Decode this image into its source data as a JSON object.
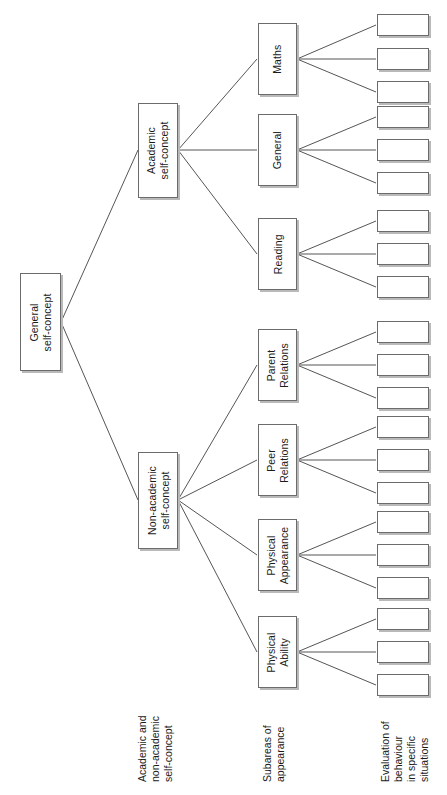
{
  "diagram": {
    "orientation": "rotated-90-ccw",
    "line_color": "#555555",
    "box_border_color": "#6b6b6b",
    "box_shadow_color": "#b9b9b9",
    "background": "#ffffff"
  },
  "root": {
    "label": "General\nself-concept",
    "line1": "General",
    "line2": "self-concept"
  },
  "level2": [
    {
      "id": "academic",
      "line1": "Academic",
      "line2": "self-concept"
    },
    {
      "id": "non-academic",
      "line1": "Non-academic",
      "line2": "self-concept"
    }
  ],
  "level3": [
    {
      "id": "maths",
      "line1": "Maths",
      "line2": ""
    },
    {
      "id": "general",
      "line1": "General",
      "line2": ""
    },
    {
      "id": "reading",
      "line1": "Reading",
      "line2": ""
    },
    {
      "id": "parent-relations",
      "line1": "Parent",
      "line2": "Relations"
    },
    {
      "id": "peer-relations",
      "line1": "Peer",
      "line2": "Relations"
    },
    {
      "id": "physical-appearance",
      "line1": "Physical",
      "line2": "Appearance"
    },
    {
      "id": "physical-ability",
      "line1": "Physical",
      "line2": "Ability"
    }
  ],
  "leaves": {
    "count": 21,
    "per_group": 3,
    "labels": [
      "",
      "",
      "",
      "",
      "",
      "",
      "",
      "",
      "",
      "",
      "",
      "",
      "",
      "",
      "",
      "",
      "",
      "",
      "",
      "",
      ""
    ]
  },
  "axis_labels": [
    {
      "id": "academic-non-academic",
      "lines": [
        "Academic and",
        "non-academic",
        "self-concept"
      ]
    },
    {
      "id": "subareas",
      "lines": [
        "Subareas of",
        "appearance"
      ]
    },
    {
      "id": "evaluation",
      "lines": [
        "Evaluation of",
        "behaviour",
        "in specific",
        "situations"
      ]
    }
  ]
}
